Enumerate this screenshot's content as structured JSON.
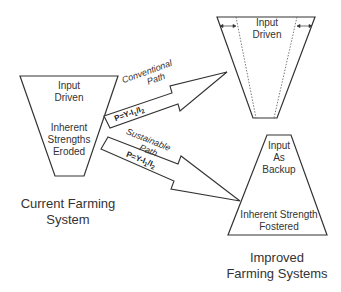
{
  "current_system": {
    "top_label": [
      "Input",
      "Driven"
    ],
    "middle_label": [
      "Inherent",
      "Strengths",
      "Eroded"
    ],
    "caption": [
      "Current Farming",
      "System"
    ]
  },
  "conventional_path": {
    "label": [
      "Conventional",
      "Path"
    ],
    "formula": "P=Y-I1/I2"
  },
  "sustainable_path": {
    "label": [
      "Sustainable",
      "Path"
    ],
    "formula": "P=Y-I1/I2"
  },
  "improved_top": {
    "label": [
      "Input",
      "Driven"
    ]
  },
  "improved_bottom": {
    "top_label": [
      "Input",
      "As",
      "Backup"
    ],
    "bottom_label": [
      "Inherent Strength",
      "Fostered"
    ]
  },
  "improved_caption": [
    "Improved",
    "Farming Systems"
  ]
}
